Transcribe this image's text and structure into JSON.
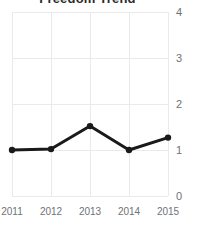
{
  "chart_data": {
    "type": "line",
    "title": "Freedom Trend",
    "xlabel": "",
    "ylabel": "",
    "categories": [
      "2011",
      "2012",
      "2013",
      "2014",
      "2015"
    ],
    "values": [
      1.0,
      1.02,
      1.52,
      1.0,
      1.27
    ],
    "series": [
      {
        "name": "Freedom Trend",
        "values": [
          1.0,
          1.02,
          1.52,
          1.0,
          1.27
        ]
      }
    ],
    "ylim": [
      0,
      4
    ],
    "y_ticks": [
      "0",
      "1",
      "2",
      "3",
      "4"
    ],
    "y_tick_values": [
      0,
      1,
      2,
      3,
      4
    ],
    "x_ticks": [
      "2011",
      "2012",
      "2013",
      "2014",
      "2015"
    ],
    "grid": true,
    "legend": "none",
    "y_axis_position": "right",
    "line_color": "#1a1a1a",
    "marker_color": "#1a1a1a",
    "grid_color": "#e8eaec",
    "tick_label_color": "#6e7277",
    "title_color": "#2b2b2b",
    "background_color": "#ffffff"
  }
}
